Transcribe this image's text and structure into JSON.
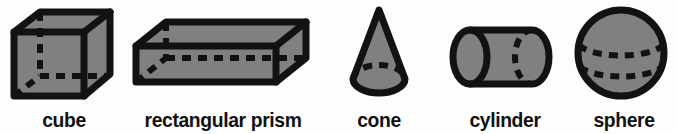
{
  "canvas": {
    "width": 678,
    "height": 134,
    "background_color": "#fdfdfd"
  },
  "style": {
    "outline_color": "#121212",
    "fill_color": "#808080",
    "hidden_edge_style": "dashed",
    "label_color": "#111111"
  },
  "title": "",
  "shapes": [
    {
      "id": "cube",
      "label": "cube",
      "faces": 6,
      "edges": 12,
      "vertices": 8,
      "hidden_edges": 3,
      "projection": "oblique"
    },
    {
      "id": "rectangular-prism",
      "label": "rectangular prism",
      "faces": 6,
      "edges": 12,
      "vertices": 8,
      "hidden_edges": 3,
      "projection": "oblique"
    },
    {
      "id": "cone",
      "label": "cone",
      "faces": 2,
      "edges": 1,
      "vertices": 1,
      "hidden_edges": 1,
      "projection": "perspective"
    },
    {
      "id": "cylinder",
      "label": "cylinder",
      "faces": 3,
      "edges": 2,
      "vertices": 0,
      "hidden_edges": 1,
      "projection": "perspective"
    },
    {
      "id": "sphere",
      "label": "sphere",
      "faces": 1,
      "edges": 0,
      "vertices": 0,
      "hidden_edges": 2,
      "projection": "perspective"
    }
  ]
}
